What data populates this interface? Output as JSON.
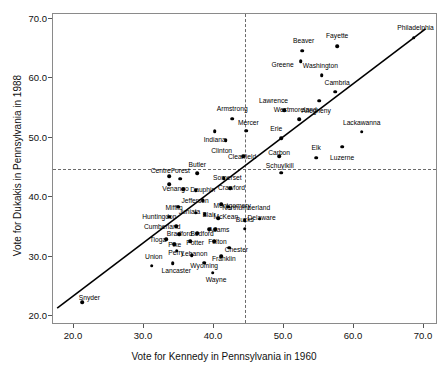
{
  "chart_data": {
    "type": "scatter",
    "title": "",
    "xlabel": "Vote for Kennedy in Pennsylvania in 1960",
    "ylabel": "Vote for Dukakis in Pennsylvania in 1988",
    "xlim": [
      17.0,
      72.0
    ],
    "ylim": [
      18.5,
      70.8
    ],
    "xticks": [
      20.0,
      30.0,
      40.0,
      50.0,
      60.0,
      70.0
    ],
    "yticks": [
      20.0,
      30.0,
      40.0,
      50.0,
      60.0,
      70.0
    ],
    "xtick_labels": [
      "20.0",
      "30.0",
      "40.0",
      "50.0",
      "60.0",
      "70.0"
    ],
    "ytick_labels": [
      "20.0",
      "30.0",
      "40.0",
      "50.0",
      "60.0",
      "70.0"
    ],
    "grid": "dashed reference lines at x=50.0 and y=50.0",
    "reference_lines": {
      "x": 50.0,
      "y": 50.0
    },
    "fit_line": {
      "x0": 17.6,
      "y0": 21.0,
      "x1": 70.5,
      "y1": 68.3
    },
    "marker": "filled circle",
    "points": [
      {
        "label": "Philadelphia",
        "x": 68.5,
        "y": 66.8,
        "lx": 68.8,
        "ly": 68.6
      },
      {
        "label": "Fayette",
        "x": 57.6,
        "y": 65.4,
        "lx": 57.6,
        "ly": 67.3
      },
      {
        "label": "Beaver",
        "x": 52.6,
        "y": 64.6,
        "lx": 52.8,
        "ly": 66.5
      },
      {
        "label": "Greene",
        "x": 52.4,
        "y": 62.9,
        "lx": 49.8,
        "ly": 62.4
      },
      {
        "label": "Washington",
        "x": 55.4,
        "y": 60.5,
        "lx": 55.2,
        "ly": 62.3
      },
      {
        "label": "Cambria",
        "x": 57.3,
        "y": 57.7,
        "lx": 57.6,
        "ly": 59.4
      },
      {
        "label": "Allegheny",
        "x": 55.0,
        "y": 56.2,
        "lx": 54.6,
        "ly": 54.7
      },
      {
        "label": "Lawrence",
        "x": 50.0,
        "y": 54.6,
        "lx": 48.5,
        "ly": 56.3
      },
      {
        "label": "Westmoreland",
        "x": 52.2,
        "y": 53.1,
        "lx": 51.6,
        "ly": 54.8
      },
      {
        "label": "Armstrong",
        "x": 42.6,
        "y": 53.2,
        "lx": 42.6,
        "ly": 55.0
      },
      {
        "label": "Mercer",
        "x": 44.6,
        "y": 51.2,
        "lx": 44.9,
        "ly": 52.7
      },
      {
        "label": "Indiana",
        "x": 40.1,
        "y": 51.1,
        "lx": 40.1,
        "ly": 49.7
      },
      {
        "label": "Erie",
        "x": 49.6,
        "y": 49.9,
        "lx": 48.9,
        "ly": 51.6
      },
      {
        "label": "Lackawanna",
        "x": 61.1,
        "y": 51.0,
        "lx": 61.1,
        "ly": 52.7
      },
      {
        "label": "Luzerne",
        "x": 58.3,
        "y": 48.5,
        "lx": 58.3,
        "ly": 46.8
      },
      {
        "label": "Clinton",
        "x": 41.7,
        "y": 49.6,
        "lx": 41.1,
        "ly": 47.9
      },
      {
        "label": "Elk",
        "x": 54.6,
        "y": 46.6,
        "lx": 54.6,
        "ly": 48.4
      },
      {
        "label": "Carbon",
        "x": 49.3,
        "y": 46.9,
        "lx": 49.3,
        "ly": 47.6
      },
      {
        "label": "Clearfield",
        "x": 44.2,
        "y": 46.9,
        "lx": 44.0,
        "ly": 47.0
      },
      {
        "label": "Schuylkill",
        "x": 49.6,
        "y": 44.1,
        "lx": 49.4,
        "ly": 45.4
      },
      {
        "label": "Butler",
        "x": 37.6,
        "y": 44.0,
        "lx": 37.6,
        "ly": 45.5
      },
      {
        "label": "Somerset",
        "x": 41.4,
        "y": 43.2,
        "lx": 41.9,
        "ly": 43.4
      },
      {
        "label": "Forest",
        "x": 35.2,
        "y": 43.1,
        "lx": 35.2,
        "ly": 44.6
      },
      {
        "label": "Centre",
        "x": 33.6,
        "y": 43.5,
        "lx": 32.4,
        "ly": 44.6
      },
      {
        "label": "Centre2",
        "x": 33.6,
        "y": 42.2,
        "lx": null,
        "ly": null
      },
      {
        "label": "Crawford",
        "x": 42.3,
        "y": 41.5,
        "lx": 42.5,
        "ly": 41.7
      },
      {
        "label": "Venango",
        "x": 35.6,
        "y": 41.3,
        "lx": 34.5,
        "ly": 41.5
      },
      {
        "label": "Dauphin",
        "x": 37.4,
        "y": 41.2,
        "lx": 38.4,
        "ly": 41.3
      },
      {
        "label": "Jefferson",
        "x": 38.4,
        "y": 39.5,
        "lx": 37.3,
        "ly": 39.6
      },
      {
        "label": "Montgomery",
        "x": 41.0,
        "y": 38.8,
        "lx": 42.6,
        "ly": 38.7
      },
      {
        "label": "Northumberland",
        "x": 42.0,
        "y": 38.4,
        "lx": 44.6,
        "ly": 38.4
      },
      {
        "label": "Mifflin",
        "x": 34.9,
        "y": 38.4,
        "lx": 34.3,
        "ly": 38.4
      },
      {
        "label": "Juniata",
        "x": 37.4,
        "y": 37.4,
        "lx": 36.5,
        "ly": 37.6
      },
      {
        "label": "Blair",
        "x": 38.7,
        "y": 37.1,
        "lx": 39.3,
        "ly": 37.1
      },
      {
        "label": "McKean",
        "x": 40.6,
        "y": 36.5,
        "lx": 41.7,
        "ly": 36.8
      },
      {
        "label": "Huntingdon",
        "x": 33.6,
        "y": 36.7,
        "lx": 32.2,
        "ly": 36.8
      },
      {
        "label": "Delaware",
        "x": 46.5,
        "y": 36.4,
        "lx": 46.8,
        "ly": 36.6
      },
      {
        "label": "Bucks",
        "x": 44.4,
        "y": 36.1,
        "lx": 44.4,
        "ly": 36.4
      },
      {
        "label": "Bucks2",
        "x": 44.4,
        "y": 34.7,
        "lx": null,
        "ly": null
      },
      {
        "label": "Cumberland",
        "x": 34.6,
        "y": 35.1,
        "lx": 32.6,
        "ly": 35.2
      },
      {
        "label": "Adams",
        "x": 40.2,
        "y": 34.6,
        "lx": 40.7,
        "ly": 34.7
      },
      {
        "label": "Adams2",
        "x": 39.3,
        "y": 34.6,
        "lx": null,
        "ly": null
      },
      {
        "label": "Bedford",
        "x": 37.6,
        "y": 33.9,
        "lx": 38.3,
        "ly": 33.9
      },
      {
        "label": "Bradford",
        "x": 35.0,
        "y": 33.8,
        "lx": 35.1,
        "ly": 33.9
      },
      {
        "label": "Fulton",
        "x": 40.0,
        "y": 32.6,
        "lx": 40.5,
        "ly": 32.6
      },
      {
        "label": "Tioga",
        "x": 33.2,
        "y": 32.9,
        "lx": 32.0,
        "ly": 32.9
      },
      {
        "label": "Potter",
        "x": 36.6,
        "y": 32.6,
        "lx": 37.3,
        "ly": 32.4
      },
      {
        "label": "Pike",
        "x": 34.3,
        "y": 32.1,
        "lx": 34.4,
        "ly": 32.1
      },
      {
        "label": "Chester",
        "x": 42.2,
        "y": 31.5,
        "lx": 43.2,
        "ly": 31.3
      },
      {
        "label": "Perry",
        "x": 34.7,
        "y": 31.0,
        "lx": 34.6,
        "ly": 30.8
      },
      {
        "label": "Lebanon",
        "x": 36.8,
        "y": 30.2,
        "lx": 37.2,
        "ly": 30.6
      },
      {
        "label": "Franklin",
        "x": 41.0,
        "y": 30.1,
        "lx": 41.4,
        "ly": 29.7
      },
      {
        "label": "Wyoming",
        "x": 38.6,
        "y": 29.0,
        "lx": 38.6,
        "ly": 28.6
      },
      {
        "label": "Union",
        "x": 31.1,
        "y": 28.5,
        "lx": 31.4,
        "ly": 30.1
      },
      {
        "label": "Lancaster",
        "x": 34.1,
        "y": 28.9,
        "lx": 34.6,
        "ly": 27.7
      },
      {
        "label": "Wayne",
        "x": 39.8,
        "y": 27.3,
        "lx": 40.3,
        "ly": 26.3
      },
      {
        "label": "Snyder",
        "x": 21.2,
        "y": 22.3,
        "lx": 22.2,
        "ly": 23.2
      }
    ]
  }
}
